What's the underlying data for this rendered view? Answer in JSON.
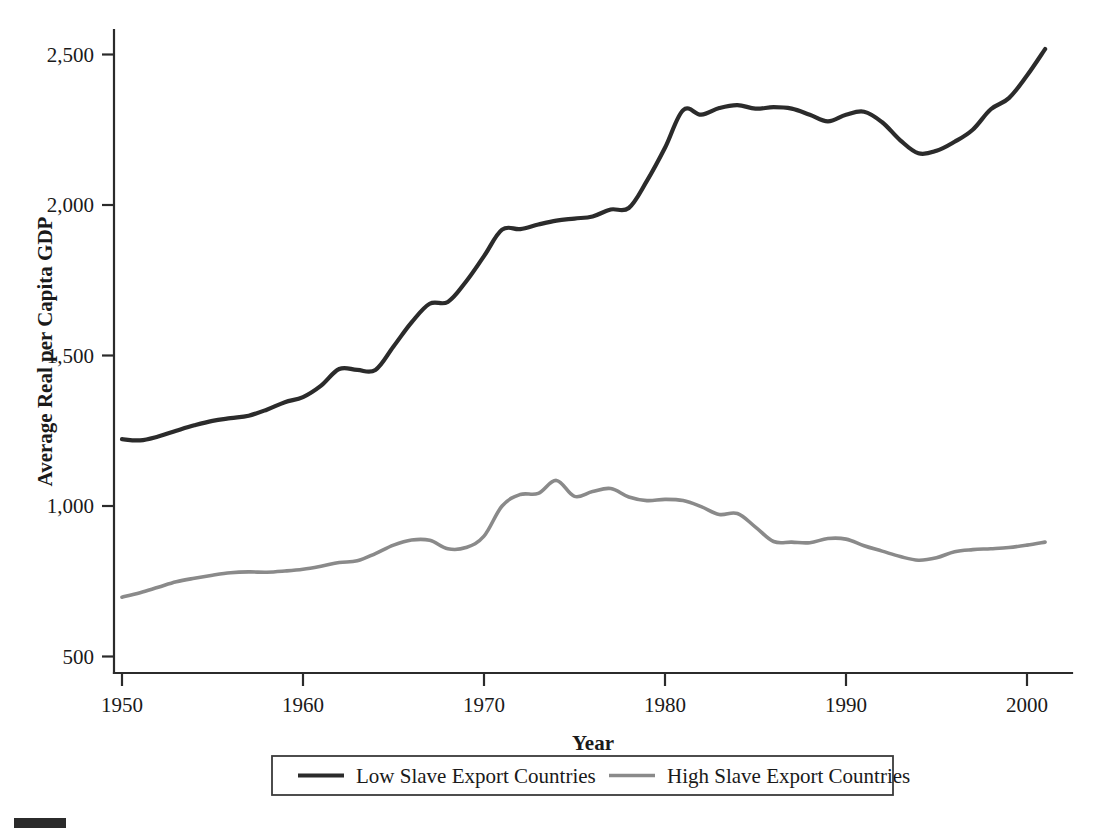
{
  "chart_data": {
    "type": "line",
    "title": "",
    "xlabel": "Year",
    "ylabel": "Average Real per Capita GDP",
    "xlim": [
      1950,
      2001
    ],
    "ylim": [
      450,
      2580
    ],
    "grid": false,
    "legend_position": "bottom-outside",
    "xticks": [
      1950,
      1960,
      1970,
      1980,
      1990,
      2000
    ],
    "xtick_labels": [
      "1950",
      "1960",
      "1970",
      "1980",
      "1990",
      "2000"
    ],
    "yticks": [
      500,
      1000,
      1500,
      2000,
      2500
    ],
    "ytick_labels": [
      "500",
      "1,000",
      "1,500",
      "2,000",
      "2,500"
    ],
    "x": [
      1950,
      1951,
      1952,
      1953,
      1954,
      1955,
      1956,
      1957,
      1958,
      1959,
      1960,
      1961,
      1962,
      1963,
      1964,
      1965,
      1966,
      1967,
      1968,
      1969,
      1970,
      1971,
      1972,
      1973,
      1974,
      1975,
      1976,
      1977,
      1978,
      1979,
      1980,
      1981,
      1982,
      1983,
      1984,
      1985,
      1986,
      1987,
      1988,
      1989,
      1990,
      1991,
      1992,
      1993,
      1994,
      1995,
      1996,
      1997,
      1998,
      1999,
      2000,
      2001
    ],
    "series": [
      {
        "name": "Low Slave Export Countries",
        "color": "#2b2b2b",
        "width": 4.2,
        "values": [
          1222,
          1218,
          1231,
          1250,
          1268,
          1283,
          1292,
          1300,
          1320,
          1345,
          1362,
          1400,
          1455,
          1452,
          1452,
          1530,
          1610,
          1672,
          1678,
          1745,
          1830,
          1918,
          1920,
          1935,
          1948,
          1955,
          1962,
          1985,
          1990,
          2080,
          2190,
          2315,
          2300,
          2322,
          2332,
          2320,
          2325,
          2320,
          2300,
          2278,
          2300,
          2310,
          2275,
          2215,
          2172,
          2180,
          2210,
          2250,
          2318,
          2355,
          2430,
          2518
        ]
      },
      {
        "name": "High Slave Export Countries",
        "color": "#8a8a8a",
        "width": 3.6,
        "values": [
          697,
          712,
          730,
          748,
          760,
          770,
          778,
          781,
          780,
          784,
          790,
          800,
          812,
          818,
          842,
          870,
          887,
          886,
          858,
          862,
          900,
          1000,
          1038,
          1042,
          1085,
          1032,
          1048,
          1058,
          1030,
          1018,
          1022,
          1018,
          998,
          972,
          975,
          930,
          882,
          880,
          878,
          892,
          890,
          868,
          850,
          832,
          820,
          828,
          848,
          855,
          858,
          862,
          870,
          880
        ]
      }
    ]
  },
  "legend": {
    "items": [
      {
        "label": "Low Slave Export Countries",
        "color": "#2b2b2b"
      },
      {
        "label": "High Slave Export Countries",
        "color": "#8a8a8a"
      }
    ]
  }
}
